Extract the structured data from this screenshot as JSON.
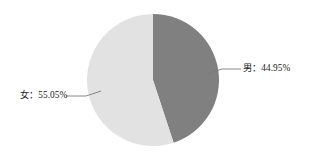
{
  "chart_data": {
    "type": "pie",
    "title": "",
    "subtitle": "",
    "xlabel": "",
    "ylabel": "",
    "grid": false,
    "legend_position": "none",
    "label_format": "{name}：{percent}%",
    "categories": [
      "男",
      "女"
    ],
    "values": [
      44.95,
      55.05
    ],
    "slices": [
      {
        "name": "男",
        "percent": 44.95,
        "percent_text": "44.95%",
        "label": "男：44.95%",
        "color": "#808080",
        "start_angle_deg": 0,
        "end_angle_deg": 161.82,
        "leader_side": "right"
      },
      {
        "name": "女",
        "percent": 55.05,
        "percent_text": "55.05%",
        "label": "女：55.05%",
        "color": "#e2e2e2",
        "start_angle_deg": 161.82,
        "end_angle_deg": 360,
        "leader_side": "left"
      }
    ],
    "geometry": {
      "center_x": 153,
      "center_y": 80,
      "radius": 66
    },
    "background_color": "#ffffff"
  },
  "labels": {
    "male": "男：44.95%",
    "female": "女：55.05%"
  }
}
